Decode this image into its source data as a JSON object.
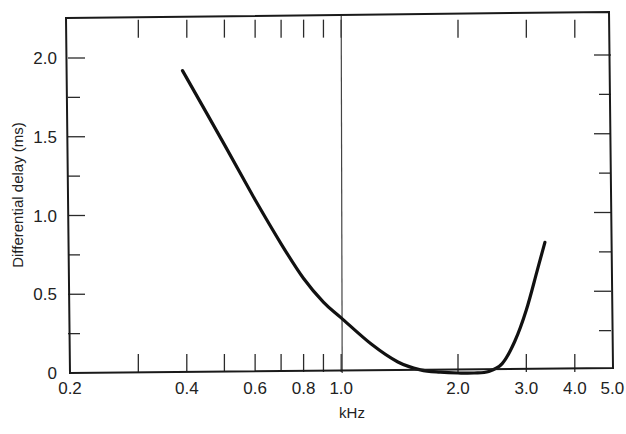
{
  "chart_data": {
    "type": "line",
    "title": "",
    "xlabel": "kHz",
    "ylabel": "Differential delay  (ms)",
    "xscale": "log",
    "xlim": [
      0.2,
      5.0
    ],
    "ylim": [
      0,
      2.25
    ],
    "grid": false,
    "legend": null,
    "x_tick_labels": [
      "0.2",
      "0.4",
      "0.6",
      "0.8",
      "1.0",
      "2.0",
      "3.0",
      "4.0",
      "5.0"
    ],
    "x_ticks": [
      0.2,
      0.3,
      0.4,
      0.5,
      0.6,
      0.7,
      0.8,
      0.9,
      1.0,
      2.0,
      3.0,
      4.0,
      5.0
    ],
    "y_tick_labels": [
      "0",
      "0.5",
      "1.0",
      "1.5",
      "2.0"
    ],
    "y_ticks": [
      0,
      0.25,
      0.5,
      0.75,
      1.0,
      1.25,
      1.5,
      1.75,
      2.0
    ],
    "reference_lines": [
      {
        "axis": "x",
        "value": 1.0
      }
    ],
    "series": [
      {
        "name": "Differential delay",
        "x": [
          0.39,
          0.5,
          0.6,
          0.7,
          0.8,
          0.9,
          1.0,
          1.2,
          1.4,
          1.6,
          1.8,
          2.0,
          2.2,
          2.4,
          2.6,
          2.8,
          3.0,
          3.2,
          3.35
        ],
        "y": [
          1.92,
          1.45,
          1.1,
          0.82,
          0.6,
          0.45,
          0.35,
          0.18,
          0.07,
          0.02,
          0.005,
          0.0,
          0.0,
          0.01,
          0.06,
          0.2,
          0.4,
          0.65,
          0.83
        ]
      }
    ]
  }
}
